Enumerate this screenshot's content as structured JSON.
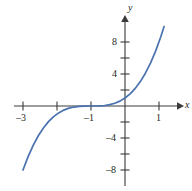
{
  "chart_data": {
    "type": "line",
    "title": "",
    "xlabel": "x",
    "ylabel": "y",
    "function": "y = (x + 1)^3",
    "xlim": [
      -3.55,
      1.65
    ],
    "ylim": [
      -10.6,
      10.6
    ],
    "grid": false,
    "legend": null,
    "x_ticks_labeled": [
      -3,
      -1,
      1
    ],
    "x_ticks_unlabeled": [
      -2,
      0
    ],
    "y_ticks_labeled": [
      8,
      4,
      -4,
      -8
    ],
    "y_ticks_unlabeled": [
      6,
      2,
      -2,
      -6
    ],
    "x_tick_labels": [
      "–3",
      "–1",
      "1"
    ],
    "y_tick_labels": [
      "8",
      "4",
      "–4",
      "–8"
    ],
    "series": [
      {
        "name": "y = (x + 1)^3",
        "color": "#4a72b0",
        "x": [
          -3.0,
          -2.85,
          -2.7,
          -2.55,
          -2.4,
          -2.25,
          -2.1,
          -1.95,
          -1.8,
          -1.65,
          -1.5,
          -1.35,
          -1.2,
          -1.05,
          -0.9,
          -0.75,
          -0.6,
          -0.45,
          -0.3,
          -0.15,
          0.0,
          0.15,
          0.3,
          0.45,
          0.6,
          0.75,
          0.9,
          1.05,
          1.15
        ],
        "y": [
          -8.0,
          -6.33,
          -4.91,
          -3.72,
          -2.74,
          -1.95,
          -1.33,
          -0.86,
          -0.51,
          -0.27,
          -0.13,
          -0.04,
          -0.01,
          0.0,
          0.0,
          0.02,
          0.06,
          0.17,
          0.34,
          0.61,
          1.0,
          1.52,
          2.2,
          3.05,
          4.1,
          5.36,
          6.86,
          8.62,
          9.94
        ]
      }
    ],
    "axes": {
      "x_axis_arrow": "right",
      "y_axis_arrow": "up",
      "axis_color": "#3a3a3a"
    }
  },
  "labels": {
    "y_axis_name": "y",
    "x_axis_name": "x",
    "y_8": "8",
    "y_4": "4",
    "y_neg4": "–4",
    "y_neg8": "–8",
    "x_neg3": "–3",
    "x_neg1": "–1",
    "x_1": "1"
  }
}
